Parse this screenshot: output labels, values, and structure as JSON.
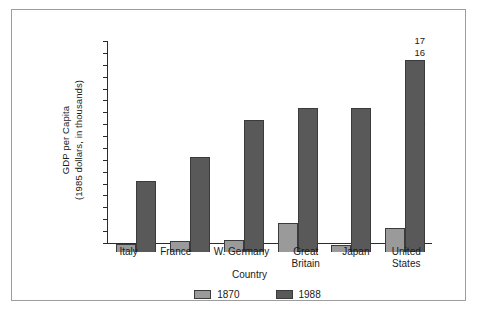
{
  "chart_data": {
    "type": "bar",
    "title": "",
    "xlabel": "Country",
    "ylabel": "GDP per Capita\n(1985 dollars, in thousands)",
    "ylabel_line1": "GDP per Capita",
    "ylabel_line2": "(1985 dollars, in thousands)",
    "categories": [
      "Italy",
      "France",
      "W. Germany",
      "Great\nBritain",
      "Japan",
      "United\nStates"
    ],
    "series": [
      {
        "name": "1870",
        "color": "#9a9a9a",
        "values": [
          0.65,
          0.9,
          1.05,
          2.45,
          0.6,
          2.0
        ]
      },
      {
        "name": "1988",
        "color": "#595959",
        "values": [
          6.0,
          8.0,
          11.1,
          12.1,
          12.1,
          16.2
        ]
      }
    ],
    "ylim": [
      0,
      17
    ],
    "ytick_labels": [
      "17",
      "16",
      "15",
      "14",
      "13",
      "12",
      "11",
      "10",
      "9",
      "8",
      "7",
      "6",
      "5",
      "4",
      "3",
      "2",
      "1",
      "0"
    ],
    "ytick_values": [
      17,
      16,
      15,
      14,
      13,
      12,
      11,
      10,
      9,
      8,
      7,
      6,
      5,
      4,
      3,
      2,
      1,
      0
    ],
    "grid": false,
    "legend_position": "bottom",
    "legend": [
      "1870",
      "1988"
    ]
  },
  "figure": {
    "border_color": "#9d9d9d",
    "background": "#ffffff"
  }
}
